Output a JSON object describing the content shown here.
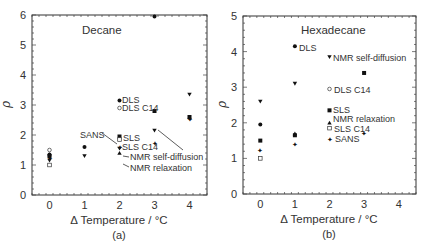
{
  "chart_data": [
    {
      "type": "scatter",
      "panel_label": "(a)",
      "title": "Decane",
      "xlabel": "Δ Temperature / °C",
      "ylabel": "ρ",
      "xlim": [
        -0.5,
        4.5
      ],
      "ylim": [
        0,
        6
      ],
      "xticks": [
        "0",
        "1",
        "2",
        "3",
        "4"
      ],
      "yticks": [
        "0",
        "1",
        "2",
        "3",
        "4",
        "5",
        "6"
      ],
      "grid": false,
      "legend": "inline annotations",
      "series": [
        {
          "name": "DLS",
          "marker": "filled-circle",
          "points": [
            [
              0,
              1.35
            ],
            [
              1,
              1.6
            ],
            [
              2,
              3.15
            ],
            [
              3,
              5.95
            ]
          ]
        },
        {
          "name": "DLS C14",
          "marker": "open-circle",
          "points": [
            [
              0,
              1.5
            ],
            [
              2,
              2.9
            ]
          ]
        },
        {
          "name": "SLS",
          "marker": "filled-square",
          "points": [
            [
              0,
              1.3
            ],
            [
              2,
              1.95
            ],
            [
              3,
              2.8
            ],
            [
              4,
              2.6
            ]
          ]
        },
        {
          "name": "SLS C14",
          "marker": "open-square",
          "points": [
            [
              0,
              1.0
            ],
            [
              2,
              1.85
            ]
          ]
        },
        {
          "name": "SANS",
          "marker": "star",
          "points": [
            [
              0,
              1.25
            ],
            [
              2,
              1.6
            ],
            [
              3,
              1.75
            ],
            [
              4,
              2.55
            ]
          ]
        },
        {
          "name": "NMR self-diffusion",
          "marker": "filled-triangle-down",
          "points": [
            [
              0,
              1.15
            ],
            [
              1,
              1.3
            ],
            [
              2,
              1.55
            ],
            [
              3,
              2.15
            ],
            [
              4,
              3.35
            ]
          ]
        },
        {
          "name": "NMR relaxation",
          "marker": "filled-triangle-up",
          "points": [
            [
              0,
              1.35
            ],
            [
              2,
              1.4
            ],
            [
              4,
              2.6
            ]
          ]
        }
      ],
      "annotations": [
        {
          "text": "DLS",
          "at": [
            2,
            3.15
          ]
        },
        {
          "text": "DLS C14",
          "at": [
            2,
            2.9
          ]
        },
        {
          "text": "SANS",
          "arrow_to": [
            2,
            1.6
          ]
        },
        {
          "text": "SLS",
          "at": [
            2,
            1.95
          ]
        },
        {
          "text": "SLS C14",
          "at": [
            2,
            1.85
          ]
        },
        {
          "text": "NMR self-diffusion",
          "arrow_to": [
            3,
            2.15
          ]
        },
        {
          "text": "NMR relaxation",
          "arrow_to": [
            2,
            1.4
          ]
        }
      ]
    },
    {
      "type": "scatter",
      "panel_label": "(b)",
      "title": "Hexadecane",
      "xlabel": "Δ Temperature / °C",
      "ylabel": "ρ",
      "xlim": [
        -0.5,
        4.5
      ],
      "ylim": [
        0,
        5
      ],
      "xticks": [
        "0",
        "1",
        "2",
        "3",
        "4"
      ],
      "yticks": [
        "0",
        "1",
        "2",
        "3",
        "4",
        "5"
      ],
      "grid": false,
      "legend": "inline annotations",
      "series": [
        {
          "name": "DLS",
          "marker": "filled-circle",
          "points": [
            [
              0,
              1.95
            ],
            [
              1,
              4.15
            ]
          ]
        },
        {
          "name": "NMR self-diffusion",
          "marker": "filled-triangle-down",
          "points": [
            [
              0,
              2.6
            ],
            [
              1,
              3.1
            ],
            [
              2,
              3.85
            ]
          ]
        },
        {
          "name": "DLS C14",
          "marker": "open-circle",
          "points": [
            [
              2,
              2.95
            ]
          ]
        },
        {
          "name": "SLS",
          "marker": "filled-square",
          "points": [
            [
              0,
              1.5
            ],
            [
              1,
              1.65
            ],
            [
              2,
              2.35
            ],
            [
              3,
              3.4
            ]
          ]
        },
        {
          "name": "NMR relaxation",
          "marker": "filled-triangle-up",
          "points": [
            [
              1,
              1.7
            ],
            [
              2,
              2.0
            ]
          ]
        },
        {
          "name": "SLS C14",
          "marker": "open-square",
          "points": [
            [
              0,
              1.0
            ],
            [
              2,
              1.85
            ]
          ]
        },
        {
          "name": "SANS",
          "marker": "star",
          "points": [
            [
              0,
              1.25
            ],
            [
              1,
              1.4
            ],
            [
              2,
              1.55
            ],
            [
              3,
              1.7
            ]
          ]
        }
      ],
      "annotations": [
        {
          "text": "DLS",
          "at": [
            1,
            4.15
          ]
        },
        {
          "text": "NMR self-diffusion",
          "at": [
            2,
            3.85
          ]
        },
        {
          "text": "DLS C14",
          "at": [
            2,
            2.95
          ]
        },
        {
          "text": "SLS",
          "at": [
            2,
            2.35
          ]
        },
        {
          "text": "NMR relaxation",
          "at": [
            2,
            2.0
          ]
        },
        {
          "text": "SLS C14",
          "at": [
            2,
            1.85
          ]
        },
        {
          "text": "SANS",
          "at": [
            2,
            1.55
          ]
        }
      ]
    }
  ],
  "labels": {
    "a": {
      "title": "Decane",
      "xlabel": "Δ Temperature / °C",
      "ylabel": "ρ",
      "panel": "(a)",
      "ann_dls": "DLS",
      "ann_dlsc14": "DLS C14",
      "ann_sans": "SANS",
      "ann_sls": "SLS",
      "ann_slsc14": "SLS C14",
      "ann_nmrsd": "NMR self-diffusion",
      "ann_nmrrel": "NMR relaxation"
    },
    "b": {
      "title": "Hexadecane",
      "xlabel": "Δ Temperature / °C",
      "ylabel": "ρ",
      "panel": "(b)",
      "ann_dls": "DLS",
      "ann_nmrsd": "NMR self-diffusion",
      "ann_dlsc14": "DLS C14",
      "ann_sls": "SLS",
      "ann_nmrrel": "NMR relaxation",
      "ann_slsc14": "SLS C14",
      "ann_sans": "SANS"
    }
  }
}
